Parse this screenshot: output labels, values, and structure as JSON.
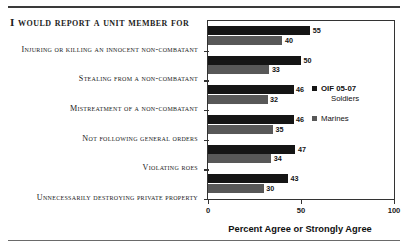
{
  "chart_data": {
    "type": "bar",
    "orientation": "horizontal",
    "title": "I WOULD REPORT A UNIT MEMBER FOR",
    "xlabel": "Percent Agree or Strongly Agree",
    "ylabel": "",
    "xlim": [
      0,
      100
    ],
    "xticks": [
      0,
      50,
      100
    ],
    "xtick_labels": [
      "0",
      "50",
      "100"
    ],
    "grid": false,
    "legend_position": "right-inside",
    "categories": [
      "INJURING OR KILLING AN INNOCENT NON-COMBATANT",
      "STEALING FROM A NON-COMBATANT",
      "MISTREATMENT OF A NON-COMBATANT",
      "NOT FOLLOWING GENERAL ORDERS",
      "VIOLATING ROES",
      "UNNECESSARILY DESTROYING PRIVATE PROPERTY"
    ],
    "series": [
      {
        "name": "OIF 05-07 Soldiers",
        "legend_line1": "OIF 05-07",
        "legend_line2": "Soldiers",
        "color": "#151515",
        "values": [
          55,
          50,
          46,
          46,
          47,
          43
        ]
      },
      {
        "name": "Marines",
        "legend_line1": "Marines",
        "legend_line2": "",
        "color": "#585858",
        "values": [
          40,
          33,
          32,
          35,
          34,
          30
        ]
      }
    ]
  }
}
